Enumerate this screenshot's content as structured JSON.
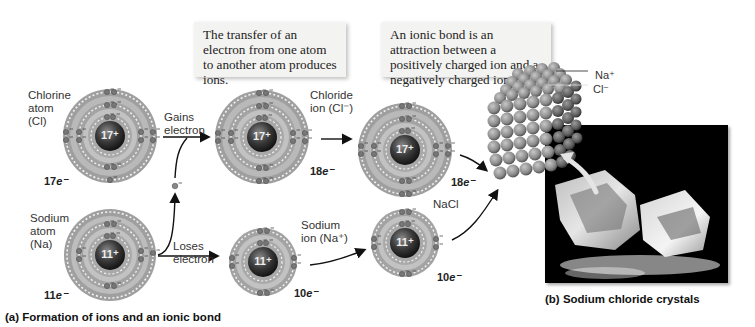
{
  "callouts": {
    "transfer": "The transfer of an electron from one atom to another atom produces ions.",
    "ionic_bond": "An ionic bond is an attraction between a positively charged ion and a negatively charged ion."
  },
  "atoms": {
    "chlorine_atom": {
      "label_line1": "Chlorine",
      "label_line2": "atom",
      "label_line3": "(Cl)",
      "nucleus": "17⁺",
      "electrons": "17",
      "e_suffix": "e⁻"
    },
    "sodium_atom": {
      "label_line1": "Sodium",
      "label_line2": "atom",
      "label_line3": "(Na)",
      "nucleus": "11⁺",
      "electrons": "11",
      "e_suffix": "e⁻"
    },
    "chloride_ion": {
      "label_line1": "Chloride",
      "label_line2": "ion (Cl⁻)",
      "nucleus": "17⁺",
      "electrons": "18",
      "e_suffix": "e⁻"
    },
    "sodium_ion": {
      "label_line1": "Sodium",
      "label_line2": "ion (Na⁺)",
      "nucleus": "11⁺",
      "electrons": "10",
      "e_suffix": "e⁻"
    },
    "nacl_chloride": {
      "nucleus": "17⁺",
      "electrons": "18",
      "e_suffix": "e⁻"
    },
    "nacl_sodium": {
      "nucleus": "11⁺",
      "electrons": "10",
      "e_suffix": "e⁻"
    }
  },
  "arrows": {
    "gains": {
      "line1": "Gains",
      "line2": "electron"
    },
    "loses": {
      "line1": "Loses",
      "line2": "electron"
    },
    "free_electron": "e⁻"
  },
  "nacl_label": "NaCl",
  "crystal_legend": {
    "na": "Na⁺",
    "cl": "Cl⁻"
  },
  "captions": {
    "a": "(a) Formation of ions and an ionic bond",
    "b": "(b) Sodium chloride crystals"
  },
  "colors": {
    "shell": "#a9a9a9",
    "nucleus": "#2b2b2b",
    "callout_bg": "#f3f3f1",
    "photo_bg": "#000000"
  }
}
